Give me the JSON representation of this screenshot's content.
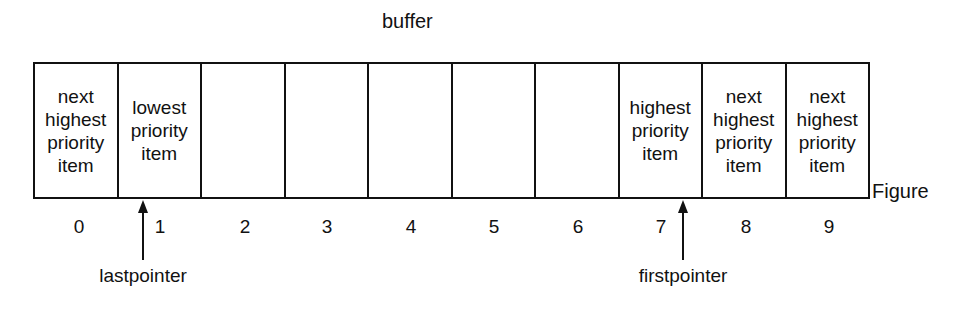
{
  "title": "buffer",
  "figure_label": "Figure",
  "cells": [
    {
      "index": "0",
      "text": "next\nhighest\npriority\nitem"
    },
    {
      "index": "1",
      "text": "lowest\npriority\nitem"
    },
    {
      "index": "2",
      "text": ""
    },
    {
      "index": "3",
      "text": ""
    },
    {
      "index": "4",
      "text": ""
    },
    {
      "index": "5",
      "text": ""
    },
    {
      "index": "6",
      "text": ""
    },
    {
      "index": "7",
      "text": "highest\npriority\nitem"
    },
    {
      "index": "8",
      "text": "next\nhighest\npriority\nitem"
    },
    {
      "index": "9",
      "text": "next\nhighest\npriority\nitem"
    }
  ],
  "pointers": {
    "last": {
      "label": "lastpointer",
      "points_to_index": 1
    },
    "first": {
      "label": "firstpointer",
      "points_to_index": 7
    }
  }
}
